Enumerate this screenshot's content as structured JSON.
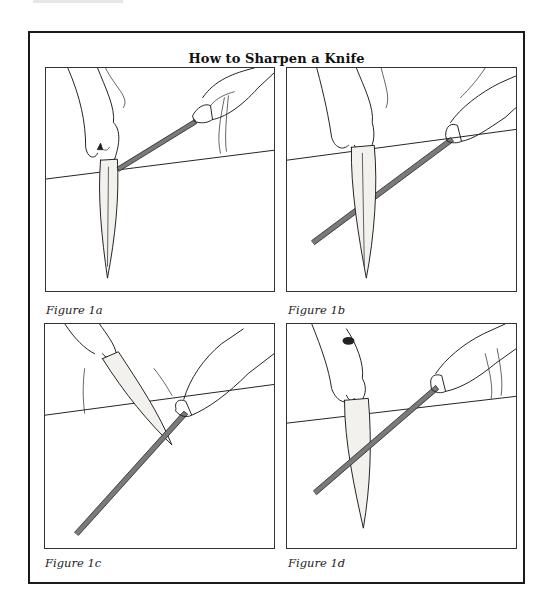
{
  "page": {
    "title": "How to Sharpen a Knife"
  },
  "figures": [
    {
      "id": "1a",
      "caption": "Figure 1a",
      "illustration": "knife held vertically, steel angled up to the right touching heel of blade"
    },
    {
      "id": "1b",
      "caption": "Figure 1b",
      "illustration": "knife held vertically, steel crossing blade diagonally downward to the left"
    },
    {
      "id": "1c",
      "caption": "Figure 1c",
      "illustration": "knife tilted diagonally, blade tip resting on steel angled down-left"
    },
    {
      "id": "1d",
      "caption": "Figure 1d",
      "illustration": "knife held vertically, steel crossing in front of blade diagonally down-left"
    }
  ],
  "colors": {
    "ink": "#222222",
    "frame": "#1a1a1a",
    "background": "#ffffff"
  }
}
